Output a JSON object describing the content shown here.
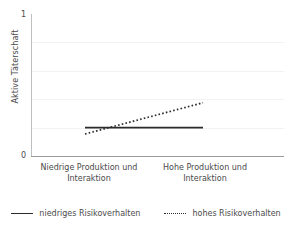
{
  "chart_data": {
    "type": "line",
    "title": "",
    "subtitle": "",
    "xlabel": "",
    "ylabel": "Aktive Täterschaft",
    "categories": [
      "Niedrige Produktion und Interaktion",
      "Hohe Produktion und Interaktion"
    ],
    "series": [
      {
        "name": "niedriges Risikoverhalten",
        "style": "solid",
        "color": "#2b2b2b",
        "values": [
          0.2,
          0.2
        ]
      },
      {
        "name": "hohes Risikoverhalten",
        "style": "dotted",
        "color": "#2b2b2b",
        "values": [
          0.155,
          0.375
        ]
      }
    ],
    "ylim": [
      0,
      1
    ],
    "y_ticks": [
      "0",
      "1"
    ],
    "y_tick_values": [
      0,
      1
    ],
    "gridlines": true,
    "gridline_values": [
      0.2,
      0.4,
      0.6,
      0.8
    ],
    "legend_position": "bottom",
    "legend_entries": [
      "niedriges Risikoverhalten",
      "hohes Risikoverhalten"
    ]
  },
  "axes": {
    "y_label": "Aktive Täterschaft",
    "y_tick_top": "1",
    "y_tick_bottom": "0",
    "x_tick_left": "Niedrige Produktion und Interaktion",
    "x_tick_right": "Hohe Produktion und Interaktion"
  },
  "legend": {
    "entries": [
      {
        "label": "niedriges Risikoverhalten",
        "marker": "solid-line-swatch"
      },
      {
        "label": "hohes Risikoverhalten",
        "marker": "dotted-line-swatch"
      }
    ]
  },
  "colors": {
    "series_line": "#2b2b2b",
    "axis": "#9a9a9a",
    "grid": "#f2f2f2",
    "text": "#4a4a4a",
    "background": "#ffffff"
  }
}
